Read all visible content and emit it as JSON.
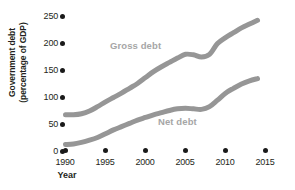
{
  "chart_data": {
    "type": "line",
    "title": "",
    "xlabel": "Year",
    "ylabel": "Government debt (percentage of GDP)",
    "ylabel_line1": "Government debt",
    "ylabel_line2": "(percentage of GDP)",
    "xlim": [
      1990,
      2015
    ],
    "ylim": [
      0,
      250
    ],
    "xticks": [
      "1990",
      "1995",
      "2000",
      "2005",
      "2010",
      "2015"
    ],
    "xtick_values": [
      1990,
      1995,
      2000,
      2005,
      2010,
      2015
    ],
    "yticks": [
      "0",
      "50",
      "100",
      "150",
      "200",
      "250"
    ],
    "ytick_values": [
      0,
      50,
      100,
      150,
      200,
      250
    ],
    "grid": false,
    "legend_position": "inline-annotation",
    "series_color": "#969696",
    "tick_color": "#1a1a1a",
    "text_color": "#231f20",
    "x": [
      1990,
      1991,
      1992,
      1993,
      1994,
      1995,
      1996,
      1997,
      1998,
      1999,
      2000,
      2001,
      2002,
      2003,
      2004,
      2005,
      2006,
      2007,
      2008,
      2009,
      2010,
      2011,
      2012,
      2013,
      2014
    ],
    "series": [
      {
        "name": "Gross debt",
        "label": "Gross debt",
        "values": [
          68,
          68,
          70,
          75,
          83,
          92,
          100,
          108,
          117,
          126,
          137,
          148,
          157,
          165,
          173,
          180,
          179,
          175,
          180,
          200,
          211,
          220,
          229,
          236,
          243
        ]
      },
      {
        "name": "Net debt",
        "label": "Net debt",
        "values": [
          13,
          14,
          17,
          21,
          26,
          33,
          40,
          46,
          52,
          58,
          63,
          68,
          72,
          76,
          79,
          80,
          79,
          78,
          83,
          95,
          108,
          117,
          125,
          131,
          135
        ]
      }
    ]
  }
}
